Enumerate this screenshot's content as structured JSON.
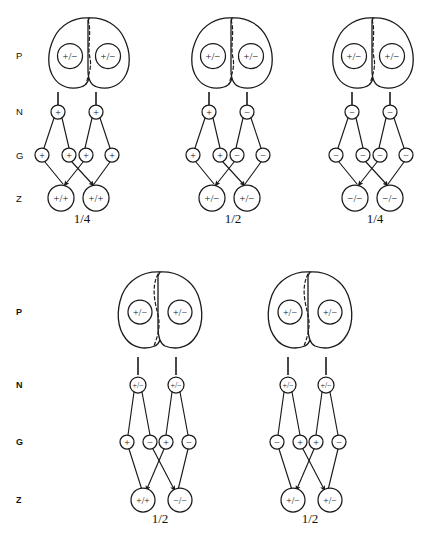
{
  "figure": {
    "row_labels_top": [
      "P",
      "N",
      "G",
      "Z"
    ],
    "row_labels_bottom": [
      "P",
      "N",
      "G",
      "Z"
    ],
    "row_meanings": {
      "P": "parent cell",
      "N": "nucleus / meiocyte",
      "G": "gamete",
      "Z": "zygote"
    },
    "symbols": {
      "plus": "+",
      "minus": "−",
      "homozygous_plus": "+/+",
      "heterozygous": "+/−",
      "homozygous_minus": "−/−"
    }
  },
  "top_panels": [
    {
      "id": "panel-1",
      "p_nuclei": [
        "+/−",
        "+/−"
      ],
      "n_circles": [
        "+",
        "+"
      ],
      "g_circles": [
        "+",
        "+",
        "+",
        "+"
      ],
      "z_circles": [
        "+/+",
        "+/+"
      ],
      "fraction": "1/4",
      "fraction_numerator": "1",
      "fraction_denominator": "4"
    },
    {
      "id": "panel-2",
      "p_nuclei": [
        "+/−",
        "+/−"
      ],
      "n_circles": [
        "+",
        "−"
      ],
      "g_circles": [
        "+",
        "+",
        "−",
        "−"
      ],
      "z_circles": [
        "+/−",
        "+/−"
      ],
      "fraction": "1/2",
      "fraction_numerator": "1",
      "fraction_denominator": "2"
    },
    {
      "id": "panel-3",
      "p_nuclei": [
        "+/−",
        "+/−"
      ],
      "n_circles": [
        "−",
        "−"
      ],
      "g_circles": [
        "−",
        "−",
        "−",
        "−"
      ],
      "z_circles": [
        "−/−",
        "−/−"
      ],
      "fraction": "1/4",
      "fraction_numerator": "1",
      "fraction_denominator": "4"
    }
  ],
  "bottom_panels": [
    {
      "id": "panel-4",
      "p_nuclei": [
        "+/−",
        "+/−"
      ],
      "n_circles": [
        "+/−",
        "+/−"
      ],
      "g_circles": [
        "+",
        "−",
        "+",
        "−"
      ],
      "z_circles": [
        "+/+",
        "−/−"
      ],
      "fraction": "1/2",
      "fraction_numerator": "1",
      "fraction_denominator": "2"
    },
    {
      "id": "panel-5",
      "p_nuclei": [
        "+/−",
        "+/−"
      ],
      "n_circles": [
        "+/−",
        "+/−"
      ],
      "g_circles": [
        "−",
        "+",
        "+",
        "−"
      ],
      "z_circles": [
        "+/−",
        "+/−"
      ],
      "fraction": "1/2",
      "fraction_numerator": "1",
      "fraction_denominator": "2"
    }
  ]
}
